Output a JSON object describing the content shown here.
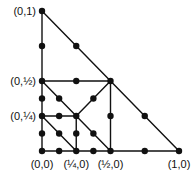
{
  "diagram": {
    "labels": [
      {
        "text": "(0,1)",
        "x": 0,
        "y": 1,
        "anchor": "left"
      },
      {
        "text": "(0,½)",
        "x": 0,
        "y": 0.5,
        "anchor": "left"
      },
      {
        "text": "(0,¼)",
        "x": 0,
        "y": 0.25,
        "anchor": "left"
      },
      {
        "text": "(0,0)",
        "x": 0,
        "y": 0,
        "anchor": "below"
      },
      {
        "text": "(¼,0)",
        "x": 0.25,
        "y": 0,
        "anchor": "below"
      },
      {
        "text": "(½,0)",
        "x": 0.5,
        "y": 0,
        "anchor": "below"
      },
      {
        "text": "(1,0)",
        "x": 1,
        "y": 0,
        "anchor": "below"
      }
    ],
    "edges": [
      [
        [
          0,
          0
        ],
        [
          1,
          0
        ]
      ],
      [
        [
          0,
          0
        ],
        [
          0,
          1
        ]
      ],
      [
        [
          0,
          1
        ],
        [
          1,
          0
        ]
      ],
      [
        [
          0,
          0.5
        ],
        [
          0.5,
          0.5
        ]
      ],
      [
        [
          0.5,
          0
        ],
        [
          0.5,
          0.5
        ]
      ],
      [
        [
          0,
          0.5
        ],
        [
          0.5,
          0
        ]
      ],
      [
        [
          0.25,
          0.25
        ],
        [
          0.5,
          0.5
        ]
      ],
      [
        [
          0,
          0.25
        ],
        [
          0.25,
          0.25
        ]
      ],
      [
        [
          0.25,
          0
        ],
        [
          0.25,
          0.25
        ]
      ],
      [
        [
          0,
          0.25
        ],
        [
          0.25,
          0
        ]
      ]
    ],
    "nodes": [
      [
        0,
        0
      ],
      [
        0,
        0.125
      ],
      [
        0,
        0.25
      ],
      [
        0,
        0.375
      ],
      [
        0,
        0.5
      ],
      [
        0,
        0.75
      ],
      [
        0,
        1
      ],
      [
        0.125,
        0
      ],
      [
        0.25,
        0
      ],
      [
        0.375,
        0
      ],
      [
        0.5,
        0
      ],
      [
        0.75,
        0
      ],
      [
        1,
        0
      ],
      [
        0.25,
        0.75
      ],
      [
        0.5,
        0.5
      ],
      [
        0.75,
        0.25
      ],
      [
        0.25,
        0.5
      ],
      [
        0.5,
        0.25
      ],
      [
        0.125,
        0.375
      ],
      [
        0.25,
        0.25
      ],
      [
        0.375,
        0.125
      ],
      [
        0.375,
        0.375
      ],
      [
        0.125,
        0.25
      ],
      [
        0.25,
        0.125
      ],
      [
        0.125,
        0.125
      ]
    ]
  }
}
